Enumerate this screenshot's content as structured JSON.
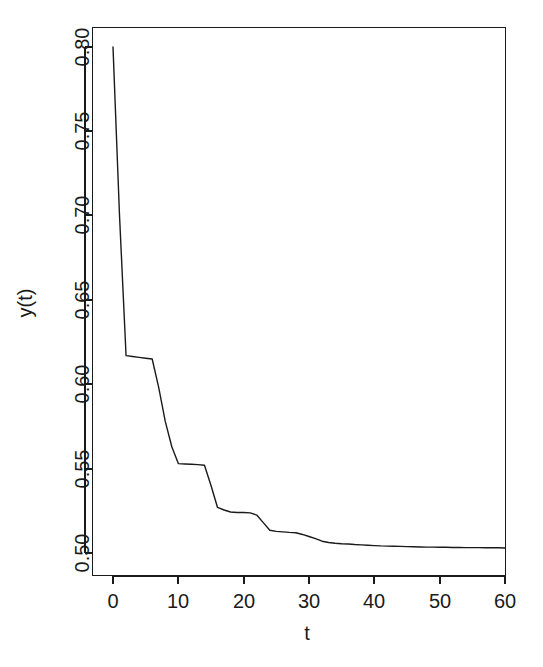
{
  "figure": {
    "background_color": "#ffffff",
    "line_color": "#1a1a1a",
    "axis_color": "#1a1a1a",
    "width": 543,
    "height": 667
  },
  "axes": {
    "x_title": "t",
    "y_title": "y(t)",
    "x_ticks": [
      "0",
      "10",
      "20",
      "30",
      "40",
      "50",
      "60"
    ],
    "y_ticks": [
      "0.50",
      "0.55",
      "0.60",
      "0.65",
      "0.70",
      "0.75",
      "0.80"
    ]
  },
  "chart_data": {
    "type": "line",
    "title": "",
    "subtitle": "",
    "xlabel": "t",
    "ylabel": "y(t)",
    "xlim": [
      -1.5,
      61.5
    ],
    "ylim": [
      0.4875,
      0.8125
    ],
    "xticks": [
      0,
      10,
      20,
      30,
      40,
      50,
      60
    ],
    "yticks": [
      0.5,
      0.55,
      0.6,
      0.65,
      0.7,
      0.75,
      0.8
    ],
    "grid": false,
    "legend": null,
    "legend_position": "none",
    "annotations": [],
    "series": [
      {
        "name": "y(t)",
        "color": "#1a1a1a",
        "x": [
          0,
          1,
          2,
          3,
          4,
          5,
          6,
          7,
          8,
          9,
          10,
          11,
          12,
          13,
          14,
          15,
          16,
          17,
          18,
          19,
          20,
          21,
          22,
          23,
          24,
          25,
          26,
          27,
          28,
          29,
          30,
          31,
          32,
          33,
          34,
          35,
          36,
          37,
          38,
          39,
          40,
          41,
          42,
          43,
          44,
          45,
          46,
          47,
          48,
          49,
          50,
          51,
          52,
          53,
          54,
          55,
          56,
          57,
          58,
          59,
          60
        ],
        "values": [
          0.8,
          0.7,
          0.617,
          0.6165,
          0.616,
          0.6155,
          0.615,
          0.598,
          0.578,
          0.563,
          0.553,
          0.5528,
          0.5526,
          0.5524,
          0.552,
          0.54,
          0.527,
          0.5255,
          0.5243,
          0.524,
          0.524,
          0.5238,
          0.5225,
          0.518,
          0.5135,
          0.5128,
          0.5125,
          0.5122,
          0.512,
          0.511,
          0.5098,
          0.5085,
          0.507,
          0.5062,
          0.5058,
          0.5055,
          0.5053,
          0.505,
          0.5048,
          0.5046,
          0.5044,
          0.5042,
          0.5041,
          0.504,
          0.5039,
          0.5038,
          0.5037,
          0.5036,
          0.5035,
          0.5035,
          0.5034,
          0.5034,
          0.5033,
          0.5033,
          0.5032,
          0.5032,
          0.5032,
          0.5031,
          0.5031,
          0.5031,
          0.503
        ]
      }
    ]
  }
}
